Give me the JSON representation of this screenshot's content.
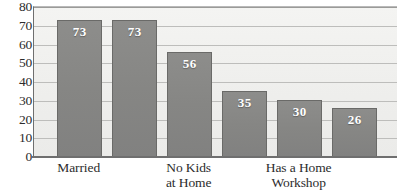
{
  "chart_data": {
    "type": "bar",
    "title": "",
    "subtitle": "",
    "xlabel": "",
    "ylabel": "",
    "ylim": [
      0,
      80
    ],
    "ytick_step": 10,
    "yticks": [
      80,
      70,
      60,
      50,
      40,
      30,
      20,
      10,
      0
    ],
    "grid": true,
    "legend": false,
    "legend_position": "none",
    "categories": [
      "Married",
      "",
      "No Kids\nat Home",
      "",
      "Has a Home\nWorkshop",
      ""
    ],
    "values": [
      73,
      73,
      56,
      35,
      30,
      26
    ],
    "bar_labels": [
      "73",
      "73",
      "56",
      "35",
      "30",
      "26"
    ],
    "series": [
      {
        "name": "",
        "values": [
          73,
          73,
          56,
          35,
          30,
          26
        ]
      }
    ],
    "axis_labels_visible": [
      "Married",
      "No Kids\nat Home",
      "Has a Home\nWorkshop"
    ],
    "colors": {
      "bar_fill": "#878785",
      "bar_border": "#6a6a68",
      "bar_label_text": "#ffffff",
      "plot_background": "#efefed",
      "gridline": "#bdbdbb",
      "axis_line": "#6f6f6f",
      "tick_text": "#2c2c2c",
      "page_background": "#ffffff"
    }
  }
}
